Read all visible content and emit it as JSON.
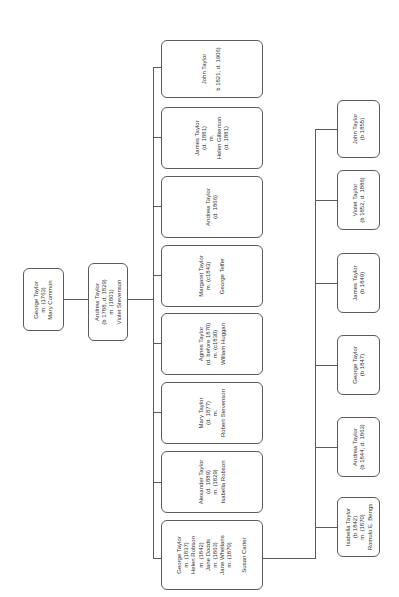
{
  "root": {
    "lines": [
      "George Taylor",
      "m. (1763)",
      "Mary Common"
    ]
  },
  "parent": {
    "lines": [
      "Andrew Taylor",
      "(b 1788, d. 1829)",
      "m. (1801)",
      "Violet Stevenson"
    ]
  },
  "children": [
    {
      "lines": [
        "John Taylor",
        "",
        "b 1821, d. 1906)"
      ]
    },
    {
      "lines": [
        "James Taylor",
        "(d. 1881)",
        "m.",
        "Helen Gilkerson",
        "(d. 1881)"
      ]
    },
    {
      "lines": [
        "Andrew Taylor",
        "(d. 1866)"
      ]
    },
    {
      "lines": [
        "Margaret Taylor",
        "m. (c1843)",
        "",
        "George Telfer"
      ]
    },
    {
      "lines": [
        "Agnes Taylor",
        "(d. before 1870)",
        "m. (c1830)",
        "William Huggan"
      ]
    },
    {
      "lines": [
        "Mary Taylor",
        "(d. 1877)",
        "m.",
        "Robert Stevenson"
      ]
    },
    {
      "lines": [
        "Alexander Taylor",
        "(d. 1889)",
        "m. (1829)",
        "Isabella Robson"
      ]
    },
    {
      "lines": [
        "George Taylor",
        "m. (1837)",
        "Helen Robson",
        "m. (1842)",
        "Jane Dodds",
        "m. (1863)",
        "Jane Whellans",
        "m. (1870)",
        "",
        "Susan Carter"
      ]
    }
  ],
  "grandchildren": [
    {
      "lines": [
        "John Taylor",
        "(b 1855)"
      ]
    },
    {
      "lines": [
        "Violet Taylor",
        "(b 1852, d. 1886)"
      ]
    },
    {
      "lines": [
        "James Taylor",
        "(b 1849)"
      ]
    },
    {
      "lines": [
        "George Taylor",
        "(b 1847)"
      ]
    },
    {
      "lines": [
        "Andrew Taylor",
        "(b 1844, d. 1863)"
      ]
    },
    {
      "lines": [
        "Isabella Taylor",
        "(b 1842)",
        "m. (1870)",
        "Romulo E. Bengs"
      ]
    }
  ]
}
